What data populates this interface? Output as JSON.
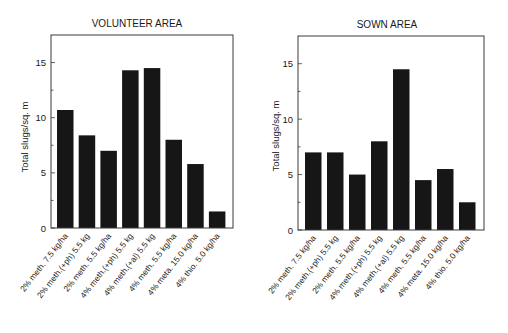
{
  "chart_data": [
    {
      "type": "bar",
      "title": "VOLUNTEER AREA",
      "xlabel": "",
      "ylabel": "Total slugs/sq. m",
      "ylim": [
        0,
        17.5
      ],
      "yticks": [
        0,
        5,
        10,
        15
      ],
      "yminor_ticks": [
        2.5,
        7.5,
        12.5
      ],
      "grid": false,
      "legend": null,
      "categories": [
        "2% meth. 7.5 kg/ha",
        "2% meth.(+ph) 5.5 kg",
        "2% meth. 5.5 kg/ha",
        "4% meth.(+ph) 5.5 kg",
        "4% meth.(+al) 5.5 kg",
        "4% meth. 5.5 kg/ha",
        "4% meta. 15.0 kg/ha",
        "4% thio. 5.0 kg/ha"
      ],
      "values": [
        10.7,
        8.4,
        7.0,
        14.3,
        14.5,
        8.0,
        5.8,
        1.5
      ],
      "bar_color": "#161616"
    },
    {
      "type": "bar",
      "title": "SOWN AREA",
      "xlabel": "",
      "ylabel": "Total slugs/sq. m",
      "ylim": [
        0,
        17.5
      ],
      "yticks": [
        0,
        5,
        10,
        15
      ],
      "yminor_ticks": [
        2.5,
        7.5,
        12.5
      ],
      "grid": false,
      "legend": null,
      "categories": [
        "2% meth. 7.5 kg/ha",
        "2% meth.(+ph) 5.5 kg",
        "2% meth. 5.5 kg/ha",
        "4% meth.(+ph) 5.5 kg",
        "4% meth.(+al) 5.5 kg",
        "4% meth. 5.5 kg/ha",
        "4% meta. 15.0 kg/ha",
        "4% thio. 5.0 kg/ha"
      ],
      "values": [
        7.0,
        7.0,
        5.0,
        8.0,
        14.5,
        4.5,
        5.5,
        2.5
      ],
      "bar_color": "#161616"
    }
  ]
}
